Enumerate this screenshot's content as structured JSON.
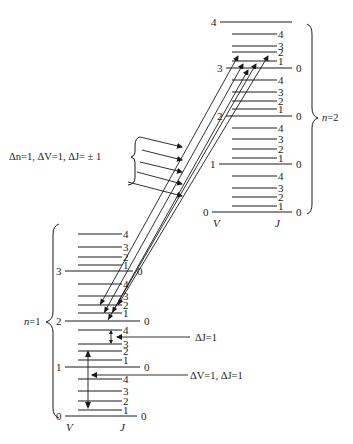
{
  "figure": {
    "upper_state": {
      "label": "n=2",
      "axis_v_label": "V",
      "axis_j_label": "J",
      "v_levels": [
        {
          "v": "0",
          "y": 212,
          "x1": 212,
          "x2": 292
        },
        {
          "v": "1",
          "y": 164,
          "x1": 219,
          "x2": 292
        },
        {
          "v": "2",
          "y": 116,
          "x1": 226,
          "x2": 292
        },
        {
          "v": "3",
          "y": 68,
          "x1": 226,
          "x2": 292
        },
        {
          "v": "4",
          "y": 22,
          "x1": 220,
          "x2": 292
        }
      ],
      "j_levels": [
        {
          "j": "1",
          "y": 206
        },
        {
          "j": "2",
          "y": 197
        },
        {
          "j": "3",
          "y": 188
        },
        {
          "j": "4",
          "y": 176
        },
        {
          "j": "1",
          "y": 158
        },
        {
          "j": "2",
          "y": 149
        },
        {
          "j": "3",
          "y": 139
        },
        {
          "j": "4",
          "y": 128
        },
        {
          "j": "1",
          "y": 109
        },
        {
          "j": "2",
          "y": 101
        },
        {
          "j": "3",
          "y": 92
        },
        {
          "j": "4",
          "y": 80
        },
        {
          "j": "1",
          "y": 61
        },
        {
          "j": "2",
          "y": 52
        },
        {
          "j": "3",
          "y": 46
        },
        {
          "j": "4",
          "y": 34
        }
      ],
      "j_line_x1": 232,
      "j_line_x2": 277
    },
    "lower_state": {
      "label": "n=1",
      "axis_v_label": "V",
      "axis_j_label": "J",
      "v_levels": [
        {
          "v": "0",
          "y": 416,
          "x1": 65,
          "x2": 137
        },
        {
          "v": "1",
          "y": 367,
          "x1": 65,
          "x2": 140
        },
        {
          "v": "2",
          "y": 321,
          "x1": 65,
          "x2": 140
        },
        {
          "v": "3",
          "y": 271,
          "x1": 65,
          "x2": 133
        }
      ],
      "j_levels": [
        {
          "j": "1",
          "y": 410
        },
        {
          "j": "2",
          "y": 401
        },
        {
          "j": "3",
          "y": 391
        },
        {
          "j": "4",
          "y": 379
        },
        {
          "j": "1",
          "y": 360
        },
        {
          "j": "2",
          "y": 351
        },
        {
          "j": "3",
          "y": 344
        },
        {
          "j": "4",
          "y": 330
        },
        {
          "j": "1",
          "y": 313
        },
        {
          "j": "2",
          "y": 305
        },
        {
          "j": "3",
          "y": 296
        },
        {
          "j": "4",
          "y": 284
        },
        {
          "j": "1",
          "y": 265
        },
        {
          "j": "2",
          "y": 257
        },
        {
          "j": "3",
          "y": 247
        },
        {
          "j": "4",
          "y": 234
        }
      ],
      "j_line_x1": 78,
      "j_line_x2": 122
    },
    "annotations": {
      "transition_group": "Δn=1, ΔV=1, ΔJ= ± 1",
      "delta_j": "ΔJ=1",
      "delta_v_delta_j": "ΔV=1, ΔJ=1"
    },
    "transitions": [
      {
        "x1": 100,
        "y1": 305,
        "x2": 238,
        "y2": 56
      },
      {
        "x1": 104,
        "y1": 313,
        "x2": 243,
        "y2": 64
      },
      {
        "x1": 108,
        "y1": 320,
        "x2": 248,
        "y2": 70
      },
      {
        "x1": 112,
        "y1": 313,
        "x2": 256,
        "y2": 64
      },
      {
        "x1": 118,
        "y1": 305,
        "x2": 268,
        "y2": 56
      }
    ]
  }
}
